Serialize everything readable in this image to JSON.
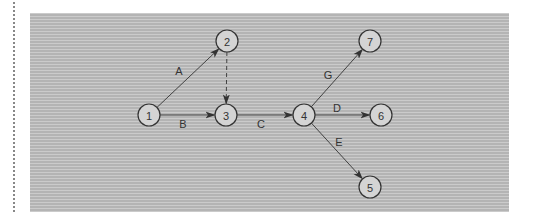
{
  "diagram": {
    "type": "activity-on-arrow network",
    "colors": {
      "stroke": "#333333",
      "node_fill": "#d4d4d4",
      "panel_stripe_light": "#cbcbcb",
      "panel_stripe_dark": "#b4b4b4"
    },
    "nodes": [
      {
        "id": "1",
        "label": "1",
        "x": 149,
        "y": 115
      },
      {
        "id": "2",
        "label": "2",
        "x": 227,
        "y": 41
      },
      {
        "id": "3",
        "label": "3",
        "x": 226,
        "y": 115
      },
      {
        "id": "4",
        "label": "4",
        "x": 304,
        "y": 115
      },
      {
        "id": "5",
        "label": "5",
        "x": 370,
        "y": 187
      },
      {
        "id": "6",
        "label": "6",
        "x": 381,
        "y": 115
      },
      {
        "id": "7",
        "label": "7",
        "x": 370,
        "y": 41
      }
    ],
    "edges": [
      {
        "from": "1",
        "to": "2",
        "label": "A",
        "style": "solid",
        "label_x": 179,
        "label_y": 71
      },
      {
        "from": "1",
        "to": "3",
        "label": "B",
        "style": "solid",
        "label_x": 183,
        "label_y": 124
      },
      {
        "from": "2",
        "to": "3",
        "label": "",
        "style": "dashed",
        "label_x": 0,
        "label_y": 0
      },
      {
        "from": "3",
        "to": "4",
        "label": "C",
        "style": "solid",
        "label_x": 261,
        "label_y": 124
      },
      {
        "from": "4",
        "to": "7",
        "label": "G",
        "style": "solid",
        "label_x": 328,
        "label_y": 75
      },
      {
        "from": "4",
        "to": "6",
        "label": "D",
        "style": "solid",
        "label_x": 337,
        "label_y": 108
      },
      {
        "from": "4",
        "to": "5",
        "label": "E",
        "style": "solid",
        "label_x": 339,
        "label_y": 142
      }
    ]
  }
}
